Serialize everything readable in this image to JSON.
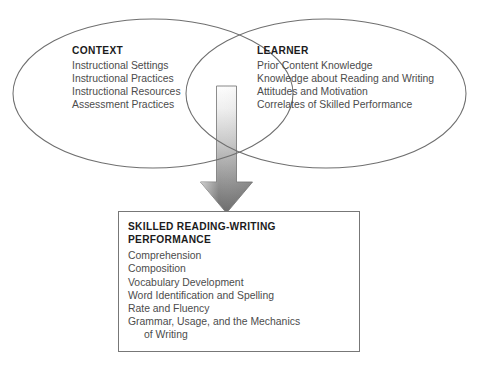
{
  "diagram": {
    "colors": {
      "ellipse_stroke": "#6f6f6f",
      "box_stroke": "#777777",
      "arrow_light": "#f2f2f2",
      "arrow_dark": "#6e6e6e",
      "arrow_outline": "#6b6b6b",
      "heading_text": "#1b1b1b",
      "body_text": "#4c4c4c",
      "background": "#ffffff"
    },
    "context": {
      "title": "CONTEXT",
      "items": [
        "Instructional Settings",
        "Instructional Practices",
        "Instructional Resources",
        "Assessment Practices"
      ]
    },
    "learner": {
      "title": "LEARNER",
      "items": [
        "Prior Content Knowledge",
        "Knowledge about Reading and Writing",
        "Attitudes and Motivation",
        "Correlates of Skilled Performance"
      ]
    },
    "outcome": {
      "title_line1": "SKILLED READING-WRITING",
      "title_line2": "PERFORMANCE",
      "items": [
        "Comprehension",
        "Composition",
        "Vocabulary Development",
        "Word Identification and Spelling",
        "Rate and Fluency",
        "Grammar, Usage, and the Mechanics\nof Writing"
      ]
    },
    "arrow": {
      "label": "downward-gradient-arrow",
      "direction": "down"
    }
  }
}
